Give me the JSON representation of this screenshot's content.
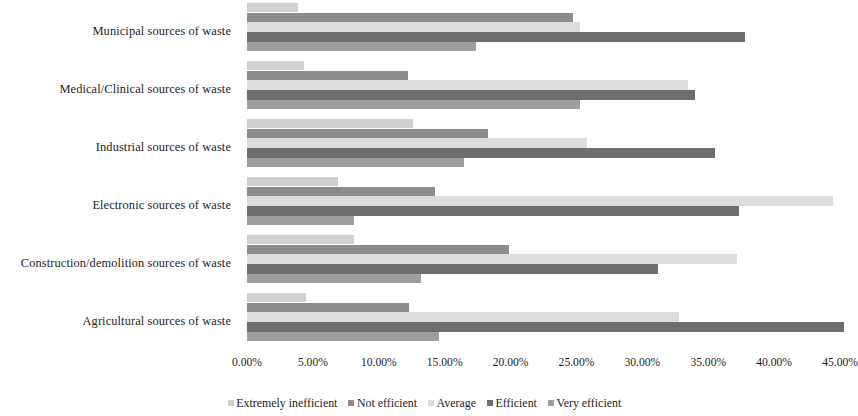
{
  "chart_data": {
    "type": "bar",
    "orientation": "horizontal",
    "title": "",
    "subtitle": "",
    "xlabel": "",
    "ylabel": "",
    "xlim": [
      0,
      45.3
    ],
    "grid": false,
    "legend_position": "bottom",
    "value_suffix": "%",
    "xticks": [
      "0.00%",
      "5.00%",
      "10.00%",
      "15.00%",
      "20.00%",
      "25.00%",
      "30.00%",
      "35.00%",
      "40.00%",
      "45.00%"
    ],
    "xtick_values": [
      0,
      5,
      10,
      15,
      20,
      25,
      30,
      35,
      40,
      45
    ],
    "categories": [
      "Municipal sources of waste",
      "Medical/Clinical sources of waste",
      "Industrial sources of waste",
      "Electronic sources of waste",
      "Construction/demolition sources of waste",
      "Agricultural sources of waste"
    ],
    "series": [
      {
        "name": "Extremely inefficient",
        "color": "#cfcfcf",
        "values": [
          3.9,
          4.3,
          12.6,
          6.9,
          8.1,
          4.5
        ]
      },
      {
        "name": "Not efficient",
        "color": "#8c8c8c",
        "values": [
          24.7,
          12.2,
          18.3,
          14.3,
          19.9,
          12.3
        ]
      },
      {
        "name": "Average",
        "color": "#dcdcdc",
        "values": [
          25.3,
          33.5,
          25.8,
          44.5,
          37.2,
          32.8
        ]
      },
      {
        "name": "Efficient",
        "color": "#6e6e6e",
        "values": [
          37.8,
          34.0,
          35.5,
          37.3,
          31.2,
          45.3
        ]
      },
      {
        "name": "Very efficient",
        "color": "#9e9e9e",
        "values": [
          17.4,
          25.3,
          16.5,
          8.1,
          13.2,
          14.6
        ]
      }
    ]
  }
}
